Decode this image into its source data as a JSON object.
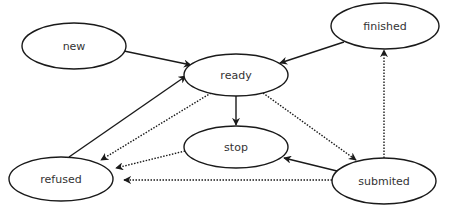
{
  "diagram": {
    "type": "state-diagram",
    "colors": {
      "stroke": "#1a1a1a",
      "fill": "#ffffff",
      "text": "#333333"
    },
    "nodes": [
      {
        "id": "new",
        "label": "new",
        "cx": 74,
        "cy": 46,
        "rx": 52,
        "ry": 23
      },
      {
        "id": "ready",
        "label": "ready",
        "cx": 236,
        "cy": 75,
        "rx": 52,
        "ry": 21
      },
      {
        "id": "finished",
        "label": "finished",
        "cx": 385,
        "cy": 26,
        "rx": 54,
        "ry": 23
      },
      {
        "id": "stop",
        "label": "stop",
        "cx": 236,
        "cy": 147,
        "rx": 52,
        "ry": 21
      },
      {
        "id": "refused",
        "label": "refused",
        "cx": 61,
        "cy": 179,
        "rx": 52,
        "ry": 22
      },
      {
        "id": "submited",
        "label": "submited",
        "cx": 384,
        "cy": 181,
        "rx": 52,
        "ry": 23
      }
    ],
    "edges": [
      {
        "from": "new",
        "to": "ready",
        "style": "solid"
      },
      {
        "from": "refused",
        "to": "ready",
        "style": "solid"
      },
      {
        "from": "finished",
        "to": "ready",
        "style": "solid"
      },
      {
        "from": "ready",
        "to": "stop",
        "style": "solid"
      },
      {
        "from": "submited",
        "to": "stop",
        "style": "solid"
      },
      {
        "from": "ready",
        "to": "refused",
        "style": "dotted"
      },
      {
        "from": "ready",
        "to": "submited",
        "style": "dotted"
      },
      {
        "from": "stop",
        "to": "refused",
        "style": "dotted"
      },
      {
        "from": "submited",
        "to": "refused",
        "style": "dotted"
      },
      {
        "from": "submited",
        "to": "finished",
        "style": "dotted"
      }
    ]
  }
}
